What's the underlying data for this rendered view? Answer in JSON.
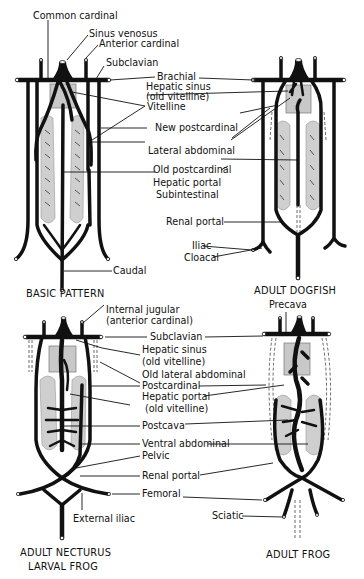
{
  "figure": {
    "panels": [
      {
        "id": "basic",
        "title": "BASIC PATTERN",
        "labels": [
          "Common cardinal",
          "Sinus venosus",
          "Anterior cardinal",
          "Subclavian",
          "Vitelline",
          "Lateral abdominal",
          "Old postcardinal",
          "Subintestinal",
          "Caudal"
        ]
      },
      {
        "id": "dogfish",
        "title": "ADULT DOGFISH",
        "labels": [
          "Brachial",
          "Hepatic sinus (old vitelline)",
          "New postcardinal",
          "Hepatic portal",
          "Renal portal",
          "Iliac",
          "Cloacal"
        ]
      },
      {
        "id": "necturus",
        "title_line1": "ADULT NECTURUS",
        "title_line2": "LARVAL FROG",
        "labels": [
          "Internal jugular (anterior cardinal)",
          "Subclavian",
          "Hepatic sinus (old vitelline)",
          "Old lateral abdominal",
          "Postcardinal",
          "Hepatic portal (old vitelline)",
          "Postcava",
          "Ventral abdominal",
          "Pelvic",
          "Renal portal",
          "Femoral",
          "External iliac"
        ]
      },
      {
        "id": "frog",
        "title": "ADULT FROG",
        "labels": [
          "Precava",
          "Sciatic"
        ]
      }
    ]
  },
  "labels": {
    "common_cardinal": "Common cardinal",
    "sinus_venosus": "Sinus venosus",
    "anterior_cardinal": "Anterior cardinal",
    "subclavian_top": "Subclavian",
    "brachial": "Brachial",
    "hepatic_sinus_1": "Hepatic sinus",
    "old_vitelline_1": "(old vitelline)",
    "vitelline": "Vitelline",
    "new_postcardinal": "New postcardinal",
    "lateral_abdominal": "Lateral abdominal",
    "old_postcardinal": "Old postcardinal",
    "hepatic_portal_top": "Hepatic portal",
    "subintestinal": "Subintestinal",
    "renal_portal_top": "Renal portal",
    "iliac": "Iliac",
    "cloacal": "Cloacal",
    "caudal": "Caudal",
    "internal_jugular": "Internal jugular",
    "anterior_cardinal_paren": "(anterior cardinal)",
    "precava": "Precava",
    "subclavian_bottom": "Subclavian",
    "hepatic_sinus_2": "Hepatic sinus",
    "old_vitelline_2": "(old vitelline)",
    "old_lateral_abdominal": "Old lateral abdominal",
    "postcardinal": "Postcardinal",
    "hepatic_portal_bottom": "Hepatic portal",
    "old_vitelline_3": "(old vitelline)",
    "postcava": "Postcava",
    "ventral_abdominal": "Ventral abdominal",
    "pelvic": "Pelvic",
    "renal_portal_bottom": "Renal portal",
    "femoral": "Femoral",
    "external_iliac": "External iliac",
    "sciatic": "Sciatic"
  },
  "titles": {
    "basic": "BASIC PATTERN",
    "dogfish": "ADULT DOGFISH",
    "necturus_1": "ADULT NECTURUS",
    "necturus_2": "LARVAL FROG",
    "frog": "ADULT FROG"
  }
}
